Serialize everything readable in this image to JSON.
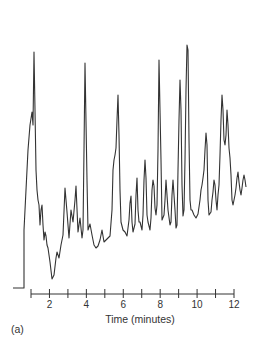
{
  "chart_data": {
    "type": "line",
    "title": "",
    "xlabel": "Time (minutes)",
    "ylabel": "",
    "panel_label": "(a)",
    "xlim": [
      1,
      12
    ],
    "x_ticks": [
      1,
      2,
      3,
      4,
      5,
      6,
      7,
      8,
      9,
      10,
      11,
      12
    ],
    "x_tick_labels": [
      "2",
      "4",
      "6",
      "8",
      "10",
      "12"
    ],
    "grid": false,
    "legend": null,
    "line_color": "#333333",
    "peaks": [
      {
        "time": 1.05,
        "height": 75
      },
      {
        "time": 1.15,
        "height": 100
      },
      {
        "time": 1.6,
        "height": 35
      },
      {
        "time": 2.7,
        "height": 42
      },
      {
        "time": 3.3,
        "height": 45
      },
      {
        "time": 4.0,
        "height": 96
      },
      {
        "time": 5.8,
        "height": 83
      },
      {
        "time": 6.5,
        "height": 58
      },
      {
        "time": 6.9,
        "height": 62
      },
      {
        "time": 7.3,
        "height": 97
      },
      {
        "time": 7.7,
        "height": 53
      },
      {
        "time": 8.5,
        "height": 83
      },
      {
        "time": 9.1,
        "height": 100
      },
      {
        "time": 9.8,
        "height": 57
      },
      {
        "time": 10.3,
        "height": 26
      },
      {
        "time": 11.1,
        "height": 50
      },
      {
        "time": 11.5,
        "height": 45
      },
      {
        "time": 12.0,
        "height": 25
      },
      {
        "time": 12.6,
        "height": 24
      }
    ],
    "trace_points": "13,288 24,288 24,230 26,190 28,150 30,125 32,112 33,125 34,52 35,110 36,170 37,190 38,200 39,205 40,225 41,210 42,205 43,225 44,240 45,232 46,236 47,245 48,248 50,262 52,279 54,275 56,258 57,252 59,258 61,245 63,235 65,188 67,212 69,238 71,210 73,222 75,200 76,186 78,232 80,218 82,238 83,230 84,150 85,63 87,180 88,230 90,224 92,235 94,245 96,248 98,246 100,240 102,230 104,242 106,240 108,238 110,236 112,210 113,170 114,160 115,155 116,148 117,120 118,95 119,135 120,190 121,222 123,230 125,232 127,236 128,228 129,220 130,203 131,196 132,222 133,232 134,228 135,224 136,195 137,178 138,210 139,222 140,222 142,230 143,215 144,180 145,160 146,178 147,215 148,222 150,230 151,218 152,190 153,180 154,186 155,208 156,215 157,205 158,150 159,60 161,160 162,220 164,215 165,200 166,180 168,210 170,225 171,222 172,195 173,180 175,210 176,228 177,225 178,170 179,120 180,80 181,110 182,185 183,216 184,210 185,160 186,90 187,45 188,50 189,140 190,200 191,210 192,210 194,215 196,218 198,214 200,200 201,190 202,185 203,178 204,170 205,150 206,133 207,145 208,200 209,215 211,212 212,200 213,192 214,180 215,185 216,200 217,210 218,195 219,185 220,155 221,120 222,95 223,110 224,140 225,145 226,135 227,110 228,125 229,148 230,158 231,175 232,200 233,205 234,200 235,195 236,188 237,178 238,172 239,182 240,190 241,195 242,188 243,180 244,175 245,180 246,187"
  }
}
